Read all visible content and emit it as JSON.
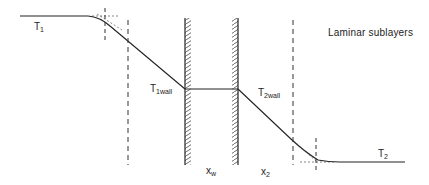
{
  "diagram": {
    "title": "Laminar sublayers",
    "labels": {
      "t1": {
        "base": "T",
        "sub": "1"
      },
      "t1wall": {
        "base": "T",
        "sub": "1wall"
      },
      "t2wall": {
        "base": "T",
        "sub": "2wall"
      },
      "t2": {
        "base": "T",
        "sub": "2"
      },
      "xw": {
        "base": "x",
        "sub": "w"
      },
      "x2": {
        "base": "x",
        "sub": "2"
      }
    },
    "colors": {
      "line": "#222222",
      "dashed": "#333333",
      "wall": "#333333"
    }
  }
}
